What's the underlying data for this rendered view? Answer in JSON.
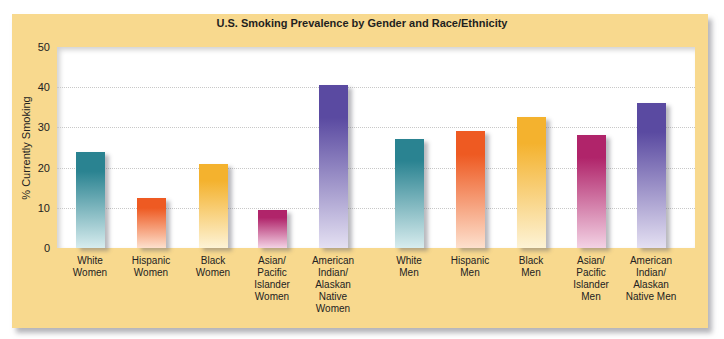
{
  "chart_data": {
    "type": "bar",
    "title": "U.S. Smoking Prevalence by Gender and Race/Ethnicity",
    "xlabel": "",
    "ylabel": "% Currently Smoking",
    "ylim": [
      0,
      50
    ],
    "yticks": [
      0,
      10,
      20,
      30,
      40,
      50
    ],
    "grid": true,
    "legend": "none",
    "categories": [
      "White Women",
      "Hispanic Women",
      "Black Women",
      "Asian/ Pacific Islander Women",
      "American Indian/ Alaskan Native Women",
      "White Men",
      "Hispanic Men",
      "Black Men",
      "Asian/ Pacific Islander Men",
      "American Indian/ Alaskan Native Men"
    ],
    "values": [
      24,
      12.5,
      21,
      9.5,
      40.5,
      27,
      29,
      32.5,
      28,
      36
    ],
    "bars": [
      {
        "label_lines": [
          "White",
          "Women"
        ],
        "value": 24,
        "x": 90,
        "color_top": "#2a8391",
        "color_bottom": "#d7ecee"
      },
      {
        "label_lines": [
          "Hispanic",
          "Women"
        ],
        "value": 12.5,
        "x": 151,
        "color_top": "#ee5a22",
        "color_bottom": "#fde0cd"
      },
      {
        "label_lines": [
          "Black",
          "Women"
        ],
        "value": 21,
        "x": 213,
        "color_top": "#f4b22e",
        "color_bottom": "#fdf3d5"
      },
      {
        "label_lines": [
          "Asian/",
          "Pacific",
          "Islander",
          "Women"
        ],
        "value": 9.5,
        "x": 272,
        "color_top": "#b0246a",
        "color_bottom": "#f3d2e4"
      },
      {
        "label_lines": [
          "American",
          "Indian/",
          "Alaskan",
          "Native",
          "Women"
        ],
        "value": 40.5,
        "x": 333,
        "color_top": "#5a4aa1",
        "color_bottom": "#e4e0f2"
      },
      {
        "label_lines": [
          "White",
          "Men"
        ],
        "value": 27,
        "x": 409,
        "color_top": "#2a8391",
        "color_bottom": "#d7ecee"
      },
      {
        "label_lines": [
          "Hispanic",
          "Men"
        ],
        "value": 29,
        "x": 470,
        "color_top": "#ee5a22",
        "color_bottom": "#fde0cd"
      },
      {
        "label_lines": [
          "Black",
          "Men"
        ],
        "value": 32.5,
        "x": 531,
        "color_top": "#f4b22e",
        "color_bottom": "#fdf3d5"
      },
      {
        "label_lines": [
          "Asian/",
          "Pacific",
          "Islander",
          "Men"
        ],
        "value": 28,
        "x": 591,
        "color_top": "#b0246a",
        "color_bottom": "#f3d2e4"
      },
      {
        "label_lines": [
          "American",
          "Indian/",
          "Alaskan",
          "Native Men"
        ],
        "value": 36,
        "x": 651,
        "color_top": "#5a4aa1",
        "color_bottom": "#e4e0f2"
      }
    ]
  },
  "colors": {
    "frame": "#f8d98e",
    "plot_bg": "#ffffff",
    "gridline": "#c8c8c8"
  }
}
